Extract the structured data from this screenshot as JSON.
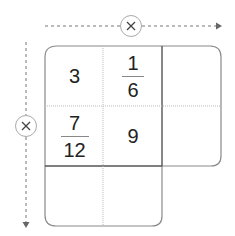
{
  "diagram": {
    "type": "multiplication-table",
    "operator_symbol": "×",
    "horizontal_operator": "×",
    "vertical_operator": "×",
    "cells": [
      [
        {
          "type": "integer",
          "value": "3"
        },
        {
          "type": "fraction",
          "numerator": "1",
          "denominator": "6"
        },
        {
          "type": "empty",
          "value": ""
        }
      ],
      [
        {
          "type": "fraction",
          "numerator": "7",
          "denominator": "12"
        },
        {
          "type": "integer",
          "value": "9"
        },
        {
          "type": "empty",
          "value": ""
        }
      ],
      [
        {
          "type": "empty",
          "value": ""
        },
        {
          "type": "empty",
          "value": ""
        }
      ]
    ],
    "colors": {
      "border": "#8a8a8a",
      "thick_border": "#555555",
      "dotted": "#bbbbbb",
      "arrow": "#777777",
      "text": "#222222"
    }
  }
}
